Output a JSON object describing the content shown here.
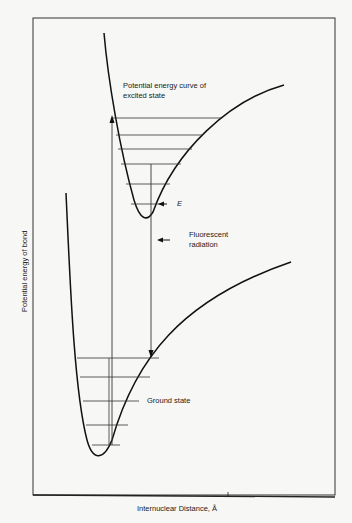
{
  "diagram": {
    "title": "",
    "ylabel": "Potential energy of bond",
    "xlabel": "Internuclear Distance, Å",
    "excited_label_line1": "Potential energy curve of",
    "excited_label_line2": "excited state",
    "ground_label": "Ground state",
    "fluorescent_line1": "Fluorescent",
    "fluorescent_line2": "radiation",
    "e_label": "E",
    "excited_vibrational_levels": 6,
    "ground_vibrational_levels": 5
  }
}
